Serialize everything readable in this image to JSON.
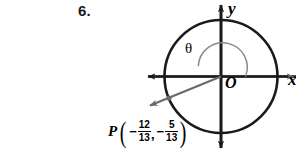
{
  "figure": {
    "problem_number": "6.",
    "background_color": "#ffffff",
    "stroke_color": "#1a1a1a",
    "ray_color": "#6b6b6b",
    "arc_color": "#8a8a8a",
    "axes": {
      "x_label": "x",
      "y_label": "y",
      "origin_label": "O"
    },
    "angle": {
      "symbol": "θ",
      "start_deg": 0,
      "end_deg": 202,
      "direction": "counterclockwise"
    },
    "circle": {
      "center_x": 221,
      "center_y": 76,
      "radius": 56,
      "label": "unit-circle"
    },
    "point": {
      "name": "P",
      "open_paren": "(",
      "close_paren": ")",
      "comma": ",",
      "x_sign": "−",
      "x_numerator": "12",
      "x_denominator": "13",
      "y_sign": "−",
      "y_numerator": "5",
      "y_denominator": "13"
    },
    "terminal_ray": {
      "from_x": 221,
      "from_y": 76,
      "to_x": 148,
      "to_y": 106
    }
  }
}
